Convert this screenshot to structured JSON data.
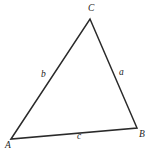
{
  "figure": {
    "kind": "geometry-diagram",
    "shape": "triangle",
    "width": 148,
    "height": 155,
    "background_color": "#ffffff",
    "stroke_color": "#2a2a2a",
    "stroke_width": 1.5,
    "label_color": "#232323"
  },
  "vertices": [
    {
      "name": "A",
      "label": "A",
      "x": 11,
      "y": 139,
      "label_x": 5,
      "label_y": 141
    },
    {
      "name": "B",
      "label": "B",
      "x": 137,
      "y": 128,
      "label_x": 139,
      "label_y": 130
    },
    {
      "name": "C",
      "label": "C",
      "x": 90,
      "y": 19,
      "label_x": 88,
      "label_y": 4
    }
  ],
  "sides": [
    {
      "name": "a",
      "label": "a",
      "from": "C",
      "to": "B",
      "label_x": 119,
      "label_y": 68
    },
    {
      "name": "b",
      "label": "b",
      "from": "A",
      "to": "C",
      "label_x": 41,
      "label_y": 70
    },
    {
      "name": "c",
      "label": "c",
      "from": "A",
      "to": "B",
      "label_x": 77,
      "label_y": 132
    }
  ],
  "path": {
    "outline": "M 11 139 L 90 19 L 137 128 Z"
  }
}
